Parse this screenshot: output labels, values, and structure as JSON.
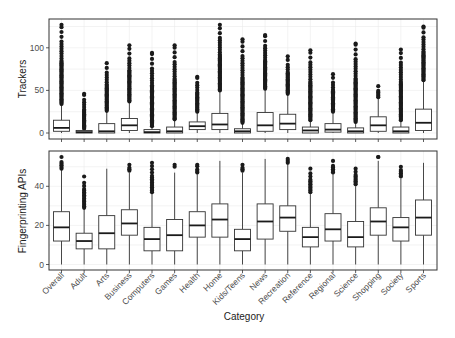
{
  "chart_data": [
    {
      "type": "boxplot",
      "title": "",
      "xlabel": "Category",
      "ylabel": "Trackers",
      "ylim": [
        -3,
        130
      ],
      "yticks": [
        0,
        50,
        100
      ],
      "grid": true,
      "legend": "none",
      "categories": [
        "Overall",
        "Adult",
        "Arts",
        "Business",
        "Computers",
        "Games",
        "Health",
        "Home",
        "Kids/Teens",
        "News",
        "Recreation",
        "Reference",
        "Regional",
        "Science",
        "Shopping",
        "Society",
        "Sports"
      ],
      "boxes": [
        {
          "category": "Overall",
          "whisker_low": 0,
          "q1": 2,
          "median": 6,
          "q3": 15,
          "whisker_high": 34,
          "outliers_range": [
            34,
            127
          ]
        },
        {
          "category": "Adult",
          "whisker_low": 0,
          "q1": 0,
          "median": 1,
          "q3": 3,
          "whisker_high": 4,
          "outliers_range": [
            5,
            46
          ]
        },
        {
          "category": "Arts",
          "whisker_low": 0,
          "q1": 0,
          "median": 2,
          "q3": 11,
          "whisker_high": 26,
          "outliers_range": [
            26,
            82
          ]
        },
        {
          "category": "Business",
          "whisker_low": 0,
          "q1": 3,
          "median": 9,
          "q3": 17,
          "whisker_high": 37,
          "outliers_range": [
            37,
            103
          ]
        },
        {
          "category": "Computers",
          "whisker_low": 0,
          "q1": 0,
          "median": 1,
          "q3": 4,
          "whisker_high": 8,
          "outliers_range": [
            8,
            94
          ]
        },
        {
          "category": "Games",
          "whisker_low": 0,
          "q1": 0,
          "median": 2,
          "q3": 7,
          "whisker_high": 16,
          "outliers_range": [
            16,
            103
          ]
        },
        {
          "category": "Health",
          "whisker_low": 0,
          "q1": 4,
          "median": 8,
          "q3": 13,
          "whisker_high": 25,
          "outliers_range": [
            25,
            66
          ]
        },
        {
          "category": "Home",
          "whisker_low": 0,
          "q1": 4,
          "median": 10,
          "q3": 23,
          "whisker_high": 50,
          "outliers_range": [
            50,
            127
          ]
        },
        {
          "category": "Kids/Teens",
          "whisker_low": 0,
          "q1": 0,
          "median": 2,
          "q3": 5,
          "whisker_high": 12,
          "outliers_range": [
            12,
            110
          ]
        },
        {
          "category": "News",
          "whisker_low": 0,
          "q1": 2,
          "median": 9,
          "q3": 24,
          "whisker_high": 52,
          "outliers_range": [
            52,
            115
          ]
        },
        {
          "category": "Recreation",
          "whisker_low": 0,
          "q1": 4,
          "median": 11,
          "q3": 22,
          "whisker_high": 46,
          "outliers_range": [
            46,
            90
          ]
        },
        {
          "category": "Reference",
          "whisker_low": 0,
          "q1": 0,
          "median": 3,
          "q3": 7,
          "whisker_high": 15,
          "outliers_range": [
            15,
            97
          ]
        },
        {
          "category": "Regional",
          "whisker_low": 0,
          "q1": 1,
          "median": 4,
          "q3": 11,
          "whisker_high": 25,
          "outliers_range": [
            25,
            69
          ]
        },
        {
          "category": "Science",
          "whisker_low": 0,
          "q1": 0,
          "median": 2,
          "q3": 6,
          "whisker_high": 13,
          "outliers_range": [
            13,
            105
          ]
        },
        {
          "category": "Shopping",
          "whisker_low": 0,
          "q1": 2,
          "median": 9,
          "q3": 19,
          "whisker_high": 42,
          "outliers_range": [
            42,
            55
          ]
        },
        {
          "category": "Society",
          "whisker_low": 0,
          "q1": 0,
          "median": 2,
          "q3": 7,
          "whisker_high": 15,
          "outliers_range": [
            15,
            98
          ]
        },
        {
          "category": "Sports",
          "whisker_low": 0,
          "q1": 3,
          "median": 12,
          "q3": 28,
          "whisker_high": 62,
          "outliers_range": [
            62,
            125
          ]
        }
      ]
    },
    {
      "type": "boxplot",
      "title": "",
      "xlabel": "Category",
      "ylabel": "Fingerprinting APIs",
      "ylim": [
        -2,
        58
      ],
      "yticks": [
        0,
        20,
        40
      ],
      "grid": true,
      "legend": "none",
      "categories": [
        "Overall",
        "Adult",
        "Arts",
        "Business",
        "Computers",
        "Games",
        "Health",
        "Home",
        "Kids/Teens",
        "News",
        "Recreation",
        "Reference",
        "Regional",
        "Science",
        "Shopping",
        "Society",
        "Sports"
      ],
      "boxes": [
        {
          "category": "Overall",
          "whisker_low": 0,
          "q1": 12,
          "median": 19,
          "q3": 27,
          "whisker_high": 49,
          "outliers_range": [
            49,
            55
          ]
        },
        {
          "category": "Adult",
          "whisker_low": 0,
          "q1": 8,
          "median": 12,
          "q3": 16,
          "whisker_high": 29,
          "outliers_range": [
            29,
            45
          ]
        },
        {
          "category": "Arts",
          "whisker_low": 0,
          "q1": 8,
          "median": 16,
          "q3": 25,
          "whisker_high": 49,
          "outliers_range": []
        },
        {
          "category": "Business",
          "whisker_low": 0,
          "q1": 15,
          "median": 21,
          "q3": 28,
          "whisker_high": 47,
          "outliers_range": [
            48,
            51
          ]
        },
        {
          "category": "Computers",
          "whisker_low": 0,
          "q1": 7,
          "median": 13,
          "q3": 19,
          "whisker_high": 37,
          "outliers_range": [
            37,
            52
          ]
        },
        {
          "category": "Games",
          "whisker_low": 0,
          "q1": 7,
          "median": 15,
          "q3": 23,
          "whisker_high": 47,
          "outliers_range": [
            50,
            51
          ]
        },
        {
          "category": "Health",
          "whisker_low": 0,
          "q1": 14,
          "median": 20,
          "q3": 27,
          "whisker_high": 46,
          "outliers_range": [
            47,
            51
          ]
        },
        {
          "category": "Home",
          "whisker_low": 0,
          "q1": 14,
          "median": 23,
          "q3": 31,
          "whisker_high": 53,
          "outliers_range": []
        },
        {
          "category": "Kids/Teens",
          "whisker_low": 0,
          "q1": 7,
          "median": 13,
          "q3": 18,
          "whisker_high": 47,
          "outliers_range": [
            48,
            51
          ]
        },
        {
          "category": "News",
          "whisker_low": 0,
          "q1": 13,
          "median": 22,
          "q3": 31,
          "whisker_high": 54,
          "outliers_range": []
        },
        {
          "category": "Recreation",
          "whisker_low": 0,
          "q1": 17,
          "median": 24,
          "q3": 30,
          "whisker_high": 51,
          "outliers_range": [
            52,
            54
          ]
        },
        {
          "category": "Reference",
          "whisker_low": 0,
          "q1": 9,
          "median": 14,
          "q3": 19,
          "whisker_high": 36,
          "outliers_range": [
            37,
            49
          ]
        },
        {
          "category": "Regional",
          "whisker_low": 0,
          "q1": 12,
          "median": 18,
          "q3": 26,
          "whisker_high": 46,
          "outliers_range": [
            47,
            53
          ]
        },
        {
          "category": "Science",
          "whisker_low": 0,
          "q1": 9,
          "median": 14,
          "q3": 22,
          "whisker_high": 40,
          "outliers_range": [
            41,
            49
          ]
        },
        {
          "category": "Shopping",
          "whisker_low": 0,
          "q1": 15,
          "median": 22,
          "q3": 29,
          "whisker_high": 53,
          "outliers_range": [
            55,
            55
          ]
        },
        {
          "category": "Society",
          "whisker_low": 0,
          "q1": 12,
          "median": 19,
          "q3": 24,
          "whisker_high": 44,
          "outliers_range": [
            45,
            50
          ]
        },
        {
          "category": "Sports",
          "whisker_low": 0,
          "q1": 15,
          "median": 24,
          "q3": 33,
          "whisker_high": 52,
          "outliers_range": []
        }
      ]
    }
  ],
  "labels": {
    "top_ylabel": "Trackers",
    "bottom_ylabel": "Fingerprinting APIs",
    "xlabel": "Category"
  },
  "style": {
    "frame_color": "#333333",
    "grid_color": "#ebebeb",
    "box_fill": "#ffffff",
    "ink": "#1a1a1a"
  }
}
